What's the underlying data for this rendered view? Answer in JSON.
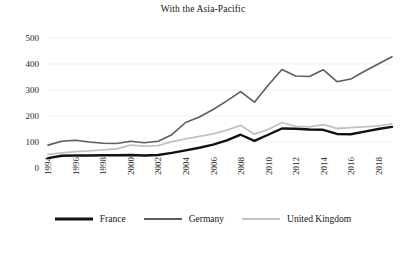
{
  "chart_data": {
    "type": "line",
    "title": "With the Asia-Pacific",
    "xlabel": "",
    "ylabel": "",
    "ylim": [
      0,
      500
    ],
    "yticks": [
      0,
      100,
      200,
      300,
      400,
      500
    ],
    "xlim": [
      1994,
      2019
    ],
    "xticks": [
      1994,
      1996,
      1998,
      2000,
      2002,
      2004,
      2006,
      2008,
      2010,
      2012,
      2014,
      2016,
      2018
    ],
    "xtick_labels": [
      "1994",
      "1996",
      "1998",
      "2000",
      "2002",
      "2004",
      "2006",
      "2008",
      "2010",
      "2012",
      "2014",
      "2016",
      "2018"
    ],
    "ytick_labels": [
      "0",
      "100",
      "200",
      "300",
      "400",
      "500"
    ],
    "grid": true,
    "grid_axis": "y",
    "legend_position": "bottom",
    "x": [
      1994,
      1995,
      1996,
      1997,
      1998,
      1999,
      2000,
      2001,
      2002,
      2003,
      2004,
      2005,
      2006,
      2007,
      2008,
      2009,
      2010,
      2011,
      2012,
      2013,
      2014,
      2015,
      2016,
      2017,
      2018,
      2019
    ],
    "series": [
      {
        "name": "France",
        "color": "#121212",
        "width": 2.4,
        "values": [
          38,
          47,
          48,
          48,
          49,
          49,
          50,
          48,
          50,
          58,
          68,
          78,
          90,
          106,
          128,
          104,
          128,
          152,
          151,
          148,
          147,
          131,
          130,
          140,
          150,
          158
        ]
      },
      {
        "name": "Germany",
        "color": "#5d5d5d",
        "width": 1.6,
        "values": [
          88,
          103,
          107,
          100,
          95,
          94,
          103,
          97,
          103,
          128,
          175,
          196,
          225,
          258,
          294,
          253,
          318,
          379,
          354,
          352,
          378,
          332,
          342,
          372,
          400,
          428
        ]
      },
      {
        "name": "United Kingdom",
        "color": "#c2c2c2",
        "width": 1.8,
        "values": [
          52,
          58,
          63,
          66,
          70,
          74,
          88,
          84,
          86,
          101,
          112,
          122,
          131,
          146,
          164,
          130,
          148,
          175,
          160,
          158,
          167,
          152,
          155,
          158,
          162,
          170
        ]
      }
    ]
  },
  "legend": {
    "items": [
      {
        "label": "France"
      },
      {
        "label": "Germany"
      },
      {
        "label": "United Kingdom"
      }
    ]
  }
}
